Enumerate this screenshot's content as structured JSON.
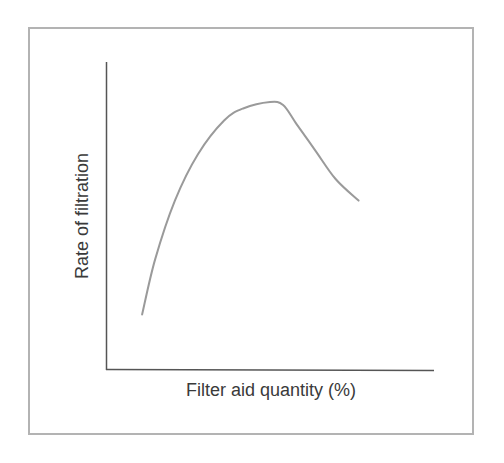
{
  "chart_data": {
    "type": "line",
    "title": "",
    "xlabel": "Filter aid quantity (%)",
    "ylabel": "Rate of filtration",
    "x_ticks": [],
    "y_ticks": [],
    "grid": false,
    "legend": null,
    "xlim": [
      0,
      100
    ],
    "ylim": [
      0,
      100
    ],
    "series": [
      {
        "name": "Rate of filtration",
        "color": "#9a9a9a",
        "x": [
          11,
          15,
          21,
          28,
          36,
          42,
          50,
          54,
          58,
          64,
          70,
          77
        ],
        "y": [
          18,
          36,
          55,
          70,
          81,
          85,
          87,
          86,
          80,
          71,
          62,
          55
        ]
      }
    ],
    "annotations": []
  },
  "colors": {
    "frame": "#b3b3b3",
    "axes": "#555555",
    "curve": "#9a9a9a",
    "text": "#3a3a3a"
  }
}
